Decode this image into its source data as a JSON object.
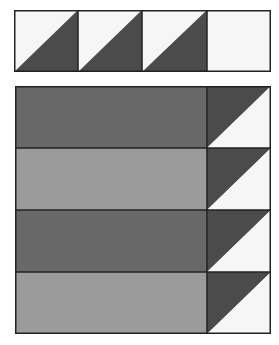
{
  "colors": {
    "white": "#f6f6f6",
    "dark_triangle": "#4b4b4b",
    "dark_strip": "#686868",
    "medium_strip": "#9b9b9b",
    "outline": "#222222"
  },
  "top_strip": {
    "units": [
      {
        "type": "half-square-triangle",
        "light": "top-left",
        "dark": "bottom-right"
      },
      {
        "type": "half-square-triangle",
        "light": "top-left",
        "dark": "bottom-right"
      },
      {
        "type": "half-square-triangle",
        "light": "top-left",
        "dark": "bottom-right"
      },
      {
        "type": "plain-square",
        "fill": "white"
      }
    ]
  },
  "main_block": {
    "rows": [
      {
        "strip": "dark",
        "triangle": {
          "dark": "top-left",
          "light": "bottom-right"
        }
      },
      {
        "strip": "medium",
        "triangle": {
          "dark": "top-left",
          "light": "bottom-right"
        }
      },
      {
        "strip": "dark",
        "triangle": {
          "dark": "top-left",
          "light": "bottom-right"
        }
      },
      {
        "strip": "medium",
        "triangle": {
          "dark": "top-left",
          "light": "bottom-right"
        }
      }
    ]
  }
}
